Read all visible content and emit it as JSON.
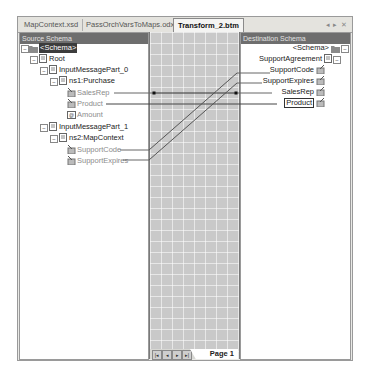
{
  "tabs": [
    {
      "label": "MapContext.xsd",
      "active": false
    },
    {
      "label": "PassOrchVarsToMaps.odx*",
      "active": false
    },
    {
      "label": "Transform_2.btm",
      "active": true
    }
  ],
  "tab_controls": {
    "left": "◂",
    "right": "▸",
    "close": "✕"
  },
  "source_schema": {
    "header": "Source Schema",
    "nodes": [
      {
        "label": "<Schema>",
        "level": 0,
        "icon": "folder-icon",
        "selected": true
      },
      {
        "label": "Root",
        "level": 1,
        "icon": "record-icon"
      },
      {
        "label": "InputMessagePart_0",
        "level": 2,
        "icon": "record-icon"
      },
      {
        "label": "ns1:Purchase",
        "level": 3,
        "icon": "record-icon"
      },
      {
        "label": "SalesRep",
        "level": 4,
        "icon": "field-element-icon",
        "linked": true
      },
      {
        "label": "Product",
        "level": 4,
        "icon": "field-element-icon",
        "linked": true
      },
      {
        "label": "Amount",
        "level": 4,
        "icon": "field-attribute-icon"
      },
      {
        "label": "InputMessagePart_1",
        "level": 2,
        "icon": "record-icon"
      },
      {
        "label": "ns2:MapContext",
        "level": 3,
        "icon": "record-icon"
      },
      {
        "label": "SupportCode",
        "level": 4,
        "icon": "field-element-icon",
        "linked": true
      },
      {
        "label": "SupportExpires",
        "level": 4,
        "icon": "field-element-icon",
        "linked": true
      }
    ]
  },
  "destination_schema": {
    "header": "Destination Schema",
    "nodes": [
      {
        "label": "<Schema>",
        "icon": "folder-icon"
      },
      {
        "label": "SupportAgreement",
        "icon": "record-icon"
      },
      {
        "label": "SupportCode",
        "icon": "field-element-icon",
        "linked": true
      },
      {
        "label": "SupportExpires",
        "icon": "field-element-icon",
        "linked": true
      },
      {
        "label": "SalesRep",
        "icon": "field-element-icon",
        "linked": true
      },
      {
        "label": "Product",
        "icon": "field-element-icon",
        "linked": true,
        "boxed": true
      }
    ]
  },
  "mapping_links": [
    {
      "from": "SalesRep",
      "to": "SalesRep"
    },
    {
      "from": "Product",
      "to": "Product"
    },
    {
      "from": "SupportCode",
      "to": "SupportCode"
    },
    {
      "from": "SupportExpires",
      "to": "SupportExpires"
    }
  ],
  "page_nav": {
    "first": "|◂",
    "prev": "◂",
    "next": "▸",
    "last": "▸|",
    "page_label": "Page 1"
  }
}
